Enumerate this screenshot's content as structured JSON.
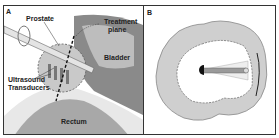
{
  "panels": [
    {
      "letter": "A",
      "labels": {
        "prostate": "Prostate",
        "treatment_plane_1": "Treatment",
        "treatment_plane_2": "plane",
        "bladder": "Bladder",
        "transducers_1": "Ultrasound",
        "transducers_2": "Transducers",
        "rectum": "Rectum"
      }
    },
    {
      "letter": "B"
    }
  ],
  "colors": {
    "tissue_gray": "#9a9a9a",
    "light_gray": "#d4d4d4",
    "border": "#333333"
  }
}
